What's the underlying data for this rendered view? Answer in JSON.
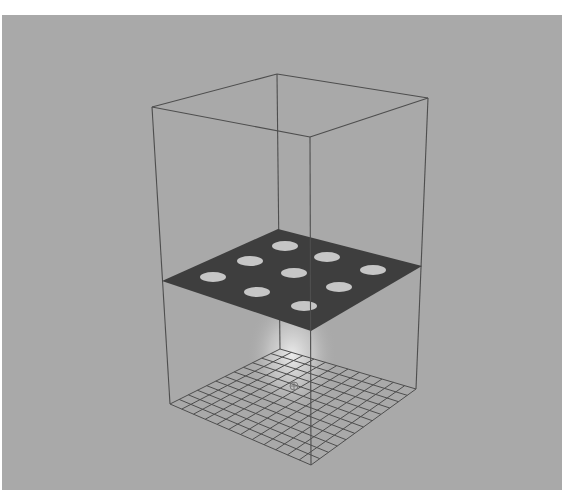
{
  "viewport": {
    "background": "#a9a9a9",
    "line_color": "#4e4e4e",
    "plate_color": "#3e3e3e",
    "hole_color": "#c6c6c6",
    "glow_color": "#e8e8e8"
  },
  "scene": {
    "bounding_box": {
      "top": [
        [
          277,
          74
        ],
        [
          428,
          98
        ],
        [
          310,
          137
        ],
        [
          152,
          107
        ]
      ],
      "bottom": [
        [
          280,
          349
        ],
        [
          416,
          389
        ],
        [
          311,
          465
        ],
        [
          170,
          404
        ]
      ]
    },
    "plate": {
      "corners": [
        [
          278,
          229
        ],
        [
          422,
          266
        ],
        [
          311,
          331
        ],
        [
          162,
          281
        ]
      ],
      "holes": [
        {
          "cx": 285,
          "cy": 246
        },
        {
          "cx": 327,
          "cy": 257
        },
        {
          "cx": 373,
          "cy": 270
        },
        {
          "cx": 250,
          "cy": 261
        },
        {
          "cx": 294,
          "cy": 273
        },
        {
          "cx": 339,
          "cy": 287
        },
        {
          "cx": 213,
          "cy": 277
        },
        {
          "cx": 257,
          "cy": 292
        },
        {
          "cx": 304,
          "cy": 306
        }
      ],
      "hole_rx": 13,
      "hole_ry": 5
    },
    "floor_grid": {
      "divisions": 12
    },
    "origin_marker": {
      "cx": 294,
      "cy": 386
    }
  }
}
